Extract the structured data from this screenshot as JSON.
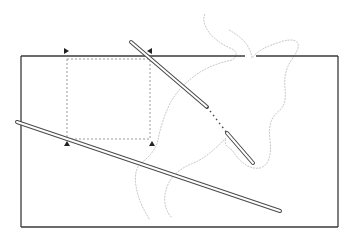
{
  "diagram": {
    "width": 358,
    "height": 237,
    "background": "#ffffff",
    "colors": {
      "outline": "#3a3a3a",
      "bar": "#4a4a4a",
      "dotted": "#9a9a9a",
      "contour": "#c8c8c8",
      "marker": "#222222"
    },
    "rectangle": {
      "x": 21,
      "y": 56,
      "width": 317,
      "height": 171
    },
    "rectangle_top_gaps": [
      [
        245,
        256
      ]
    ],
    "dotted_square": {
      "x": 67,
      "y": 59,
      "width": 83,
      "height": 80
    },
    "markers": [
      {
        "name": "marker-top-left",
        "x": 66,
        "y": 51,
        "dir": "right"
      },
      {
        "name": "marker-top-right",
        "x": 150,
        "y": 51,
        "dir": "left"
      },
      {
        "name": "marker-bottom-left",
        "x": 67,
        "y": 144,
        "dir": "up"
      },
      {
        "name": "marker-bottom-right",
        "x": 152,
        "y": 144,
        "dir": "up"
      }
    ],
    "bars": [
      {
        "name": "diagonal-bar-upper",
        "x1": 131,
        "y1": 42,
        "x2": 207,
        "y2": 107,
        "style": "solid"
      },
      {
        "name": "diagonal-bar-gap",
        "x1": 207,
        "y1": 107,
        "x2": 227,
        "y2": 133,
        "style": "dashed"
      },
      {
        "name": "diagonal-bar-lower",
        "x1": 227,
        "y1": 133,
        "x2": 253,
        "y2": 163,
        "style": "solid"
      },
      {
        "name": "long-bar",
        "x1": 17,
        "y1": 122,
        "x2": 280,
        "y2": 211,
        "style": "solid"
      }
    ],
    "contours": [
      "M205,14 C200,25 212,40 230,48 C240,52 236,58 232,60 C222,62 210,66 200,72 C188,80 178,90 172,100 C166,110 160,128 158,140 C156,150 148,158 140,164 C132,172 134,196 150,220",
      "M229,30 C240,36 250,44 252,58 C258,50 268,46 280,42 C292,38 300,40 298,48 C296,56 288,62 286,72 C282,86 290,100 280,110 C272,116 268,124 270,140 C272,156 268,166 260,168 C248,170 238,160 232,150 C226,146 224,144 226,138",
      "M226,138 C218,146 208,156 196,162 C180,168 170,176 166,190 C162,204 168,214 172,218"
    ]
  }
}
